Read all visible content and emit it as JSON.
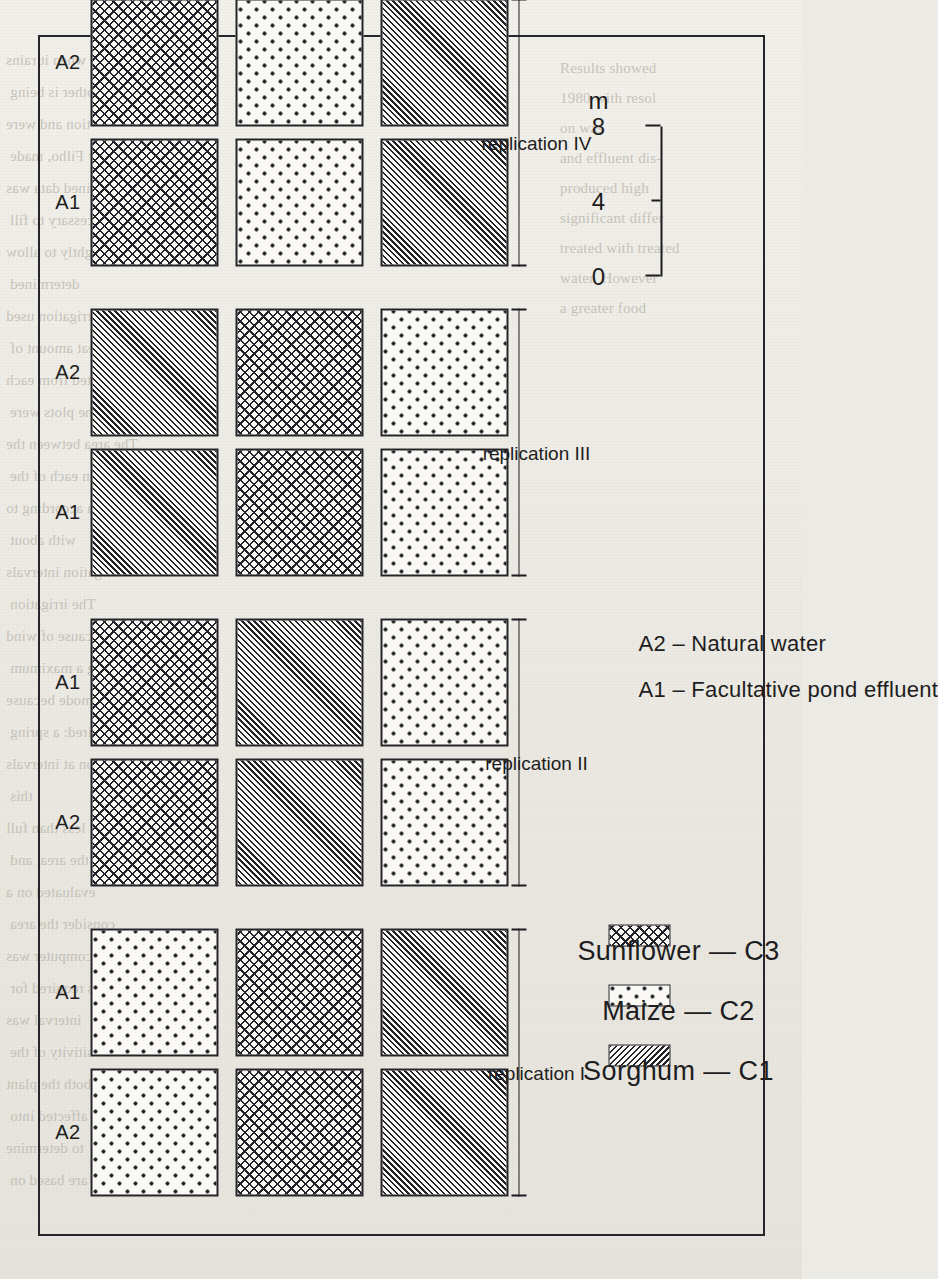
{
  "page": {
    "kind": "scanned-journal-page",
    "background_color": "#eeece6",
    "ink_color": "#1d1d21"
  },
  "figure": {
    "frame": {
      "border_color": "#26262a"
    },
    "column_labels": [
      "A2",
      "A1"
    ],
    "replications": [
      {
        "label": "replication I",
        "roman": "I",
        "columns": [
          {
            "water": "A2",
            "crops": [
              "dots",
              "cross",
              "diag"
            ]
          },
          {
            "water": "A1",
            "crops": [
              "dots",
              "cross",
              "diag"
            ]
          }
        ]
      },
      {
        "label": "replication II",
        "roman": "II",
        "columns": [
          {
            "water": "A2",
            "crops": [
              "cross",
              "diag",
              "dots"
            ]
          },
          {
            "water": "A1",
            "crops": [
              "cross",
              "diag",
              "dots"
            ]
          }
        ]
      },
      {
        "label": "replication III",
        "roman": "III",
        "columns": [
          {
            "water": "A1",
            "crops": [
              "diag",
              "cross",
              "dots"
            ]
          },
          {
            "water": "A2",
            "crops": [
              "diag",
              "cross",
              "dots"
            ]
          }
        ]
      },
      {
        "label": "replication IV",
        "roman": "IV",
        "columns": [
          {
            "water": "A1",
            "crops": [
              "cross",
              "dots",
              "diag"
            ]
          },
          {
            "water": "A2",
            "crops": [
              "cross",
              "dots",
              "diag"
            ]
          }
        ]
      },
      {
        "label": "replication V",
        "roman": "V",
        "columns": [
          {
            "water": "A1",
            "crops": [
              "diag",
              "dots",
              "cross"
            ]
          },
          {
            "water": "A2",
            "crops": [
              "diag",
              "dots",
              "cross"
            ]
          }
        ]
      },
      {
        "label": "replication VI",
        "roman": "VI",
        "columns": [
          {
            "water": "A2",
            "crops": [
              "dots",
              "diag",
              "cross"
            ]
          },
          {
            "water": "A1",
            "crops": [
              "dots",
              "diag",
              "cross"
            ]
          }
        ]
      }
    ],
    "crop_legend": [
      {
        "pattern": "diag",
        "label": "Sorghum  —  C1"
      },
      {
        "pattern": "dots",
        "label": "Maize  —  C2"
      },
      {
        "pattern": "cross",
        "label": "Sunflower  —  C3"
      }
    ],
    "water_legend": [
      {
        "code": "A1",
        "text": "A1  –  Facultative pond effluent"
      },
      {
        "code": "A2",
        "text": "A2  –  Natural water"
      }
    ],
    "scale_bar": {
      "ticks": [
        "0",
        "4",
        "8"
      ],
      "unit": "m"
    }
  },
  "bleed_through": {
    "left_column": [
      "were put out only when it rains",
      "other is being",
      "tion and were",
      "by Filho, made",
      "mined data was",
      "was Necessary to fill",
      "only slightly to allow",
      "determined",
      "The main irrigation used",
      "great amount of",
      "are collected from each",
      "tions of the plots were",
      "The area between the",
      "lots in each of the",
      "area according to",
      "with about",
      "rrigation intervals",
      "The irrigation",
      "cause of wind",
      "tering a maximum",
      "this mode because",
      "required: a spring",
      "gation at intervals",
      "this",
      "at less than full",
      "of the area, and",
      "evaluated on a",
      "consider the area",
      "a computer was",
      "is required for",
      "interval was",
      "sensitivity of the",
      "which both the plant",
      "was affected into",
      "to determine",
      "are based on"
    ],
    "right_column": [
      "Results showed",
      "1980 with resol",
      "on was",
      "and effluent dis-",
      "produced high",
      "significant differ",
      "treated with treated",
      "water. However",
      "a greater food"
    ]
  }
}
